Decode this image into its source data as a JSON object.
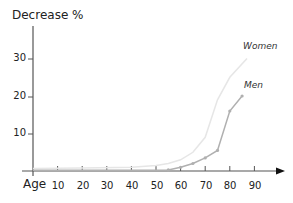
{
  "chart_data": {
    "type": "line",
    "title": "",
    "xlabel": "Age",
    "ylabel": "Decrease %",
    "xlim": [
      0,
      95
    ],
    "ylim": [
      0,
      35
    ],
    "x_ticks": [
      10,
      20,
      30,
      40,
      50,
      60,
      70,
      80,
      90
    ],
    "y_ticks": [
      10,
      20,
      30
    ],
    "grid": false,
    "legend_position": "inline labels at line ends",
    "series": [
      {
        "name": "Women",
        "color": "#e6e6e6",
        "markers": false,
        "x": [
          0,
          20,
          40,
          50,
          55,
          60,
          65,
          70,
          75,
          80,
          87
        ],
        "values": [
          0.7,
          0.8,
          1.0,
          1.5,
          2.0,
          3.0,
          5.0,
          9.0,
          19.0,
          25.0,
          30.0
        ]
      },
      {
        "name": "Men",
        "color": "#b0b0b0",
        "markers": true,
        "x": [
          0,
          20,
          40,
          50,
          55,
          60,
          65,
          70,
          75,
          80,
          85
        ],
        "values": [
          0.2,
          0.2,
          0.2,
          0.2,
          0.3,
          1.0,
          2.0,
          3.5,
          5.5,
          16.0,
          20.0
        ]
      }
    ]
  },
  "labels": {
    "ylabel": "Decrease %",
    "xlabel": "Age",
    "women": "Women",
    "men": "Men",
    "y30": "30",
    "y20": "20",
    "y10": "10",
    "x10": "10",
    "x20": "20",
    "x30": "30",
    "x40": "40",
    "x50": "50",
    "x60": "60",
    "x70": "70",
    "x80": "80",
    "x90": "90"
  }
}
